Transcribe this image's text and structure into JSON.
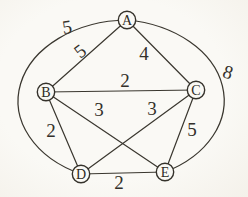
{
  "figure": {
    "width": 248,
    "height": 197,
    "paper_color": "#f9f7f2",
    "ink_color": "#3a372f"
  },
  "graph": {
    "node_radius": 8.7,
    "arc": {
      "cx": 126,
      "cy": 100,
      "rx": 111,
      "ry": 81
    },
    "nodes": [
      {
        "id": "A",
        "label": "A",
        "x": 127,
        "y": 20
      },
      {
        "id": "B",
        "label": "B",
        "x": 46,
        "y": 92
      },
      {
        "id": "C",
        "label": "C",
        "x": 196,
        "y": 90
      },
      {
        "id": "D",
        "label": "D",
        "x": 81,
        "y": 174
      },
      {
        "id": "E",
        "label": "E",
        "x": 165,
        "y": 172
      }
    ],
    "edges": [
      {
        "from": "A",
        "to": "B",
        "weight": "5",
        "curve": "",
        "label_x": 80,
        "label_y": 51,
        "label_rotate": -38
      },
      {
        "from": "A",
        "to": "C",
        "weight": "4",
        "curve": "",
        "label_x": 144,
        "label_y": 53,
        "label_rotate": 0
      },
      {
        "from": "A",
        "to": "D",
        "weight": "5",
        "curve": "left-arc",
        "label_x": 67,
        "label_y": 27,
        "label_rotate": -8
      },
      {
        "from": "A",
        "to": "E",
        "weight": "8",
        "curve": "right-arc",
        "label_x": 228,
        "label_y": 72,
        "label_rotate": 18
      },
      {
        "from": "B",
        "to": "C",
        "weight": "2",
        "curve": "",
        "label_x": 125,
        "label_y": 80,
        "label_rotate": 0
      },
      {
        "from": "B",
        "to": "D",
        "weight": "2",
        "curve": "",
        "label_x": 51,
        "label_y": 130,
        "label_rotate": 0
      },
      {
        "from": "B",
        "to": "E",
        "weight": "3",
        "curve": "",
        "label_x": 99,
        "label_y": 109,
        "label_rotate": 0
      },
      {
        "from": "C",
        "to": "D",
        "weight": "3",
        "curve": "",
        "label_x": 152,
        "label_y": 108,
        "label_rotate": 0
      },
      {
        "from": "C",
        "to": "E",
        "weight": "5",
        "curve": "",
        "label_x": 192,
        "label_y": 129,
        "label_rotate": 0
      },
      {
        "from": "D",
        "to": "E",
        "weight": "2",
        "curve": "",
        "label_x": 119,
        "label_y": 182,
        "label_rotate": 0
      }
    ]
  }
}
